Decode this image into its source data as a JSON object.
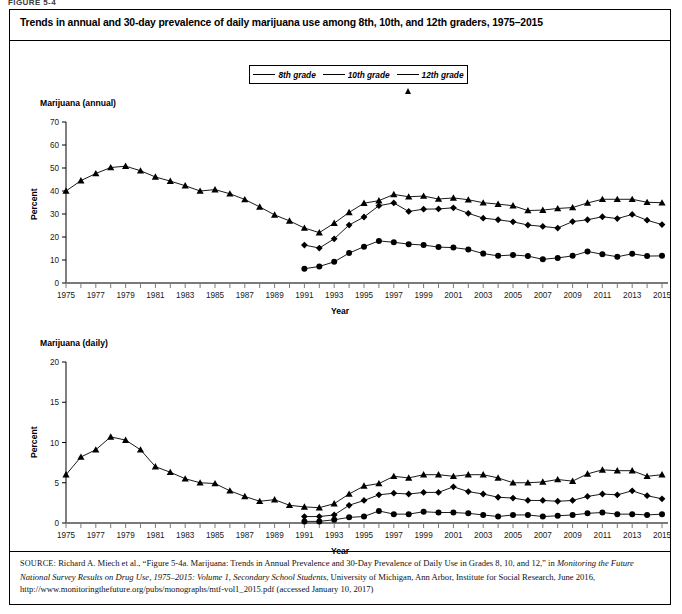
{
  "figure_number": "FIGURE 5-4",
  "title": "Trends in annual and 30-day prevalence of daily marijuana use among 8th, 10th, and 12th graders, 1975–2015",
  "legend": {
    "items": [
      {
        "label": "8th grade",
        "marker": "circle-marker",
        "color": "#000000"
      },
      {
        "label": "10th grade",
        "marker": "diamond-marker",
        "color": "#000000"
      },
      {
        "label": "12th grade",
        "marker": "triangle-marker",
        "color": "#000000"
      }
    ]
  },
  "source": {
    "prefix": "SOURCE:",
    "line1": " Richard A. Miech et al., “Figure 5-4a. Marijuana: Trends in Annual Prevalence and 30-Day Prevalence of Daily Use in Grades 8, 10, and 12,” in ",
    "italic1": "Monitoring the Future National Survey Results on Drug Use, 1975–2015: Volume 1, Secondary School Students",
    "line2": ", University of Michigan, Ann Arbor, Institute for Social Research, June 2016, http://www.monitoringthefuture.org/pubs/monographs/mtf-vol1_2015.pdf (accessed January 10, 2017)"
  },
  "chart_data": [
    {
      "type": "line",
      "title": "Marijuana (annual)",
      "xlabel": "Year",
      "ylabel": "Percent",
      "ylim": [
        0,
        70
      ],
      "yticks": [
        0,
        10,
        20,
        30,
        40,
        50,
        60,
        70
      ],
      "xlim": [
        1975,
        2015
      ],
      "xticks": [
        1975,
        1976,
        1977,
        1978,
        1979,
        1980,
        1981,
        1982,
        1983,
        1984,
        1985,
        1986,
        1987,
        1988,
        1989,
        1990,
        1991,
        1992,
        1993,
        1994,
        1995,
        1996,
        1997,
        1998,
        1999,
        2000,
        2001,
        2002,
        2003,
        2004,
        2005,
        2006,
        2007,
        2008,
        2009,
        2010,
        2011,
        2012,
        2013,
        2014,
        2015
      ],
      "xticklabels": [
        "1975",
        "",
        "1977",
        "",
        "1979",
        "",
        "1981",
        "",
        "1983",
        "",
        "1985",
        "",
        "1987",
        "",
        "1989",
        "",
        "1991",
        "",
        "1993",
        "",
        "1995",
        "",
        "1997",
        "",
        "1999",
        "",
        "2001",
        "",
        "2003",
        "",
        "2005",
        "",
        "2007",
        "",
        "2009",
        "",
        "2011",
        "",
        "2013",
        "",
        "2015"
      ],
      "grid": false,
      "legend_position": "above-plot",
      "series": [
        {
          "name": "8th grade",
          "marker": "circle",
          "x": [
            1991,
            1992,
            1993,
            1994,
            1995,
            1996,
            1997,
            1998,
            1999,
            2000,
            2001,
            2002,
            2003,
            2004,
            2005,
            2006,
            2007,
            2008,
            2009,
            2010,
            2011,
            2012,
            2013,
            2014,
            2015
          ],
          "values": [
            6.2,
            7.2,
            9.2,
            13.0,
            15.8,
            18.3,
            17.7,
            16.9,
            16.5,
            15.6,
            15.4,
            14.6,
            12.8,
            11.8,
            12.2,
            11.7,
            10.3,
            10.9,
            11.8,
            13.7,
            12.5,
            11.4,
            12.7,
            11.7,
            11.8
          ]
        },
        {
          "name": "10th grade",
          "marker": "diamond",
          "x": [
            1991,
            1992,
            1993,
            1994,
            1995,
            1996,
            1997,
            1998,
            1999,
            2000,
            2001,
            2002,
            2003,
            2004,
            2005,
            2006,
            2007,
            2008,
            2009,
            2010,
            2011,
            2012,
            2013,
            2014,
            2015
          ],
          "values": [
            16.5,
            15.2,
            19.2,
            25.2,
            28.7,
            33.6,
            34.8,
            31.1,
            32.1,
            32.2,
            32.7,
            30.3,
            28.2,
            27.5,
            26.6,
            25.2,
            24.6,
            23.9,
            26.7,
            27.5,
            28.8,
            28.0,
            29.8,
            27.3,
            25.4
          ]
        },
        {
          "name": "12th grade",
          "marker": "triangle",
          "x": [
            1975,
            1976,
            1977,
            1978,
            1979,
            1980,
            1981,
            1982,
            1983,
            1984,
            1985,
            1986,
            1987,
            1988,
            1989,
            1990,
            1991,
            1992,
            1993,
            1994,
            1995,
            1996,
            1997,
            1998,
            1999,
            2000,
            2001,
            2002,
            2003,
            2004,
            2005,
            2006,
            2007,
            2008,
            2009,
            2010,
            2011,
            2012,
            2013,
            2014,
            2015
          ],
          "values": [
            40.0,
            44.5,
            47.6,
            50.2,
            50.8,
            48.8,
            46.1,
            44.3,
            42.3,
            40.0,
            40.6,
            38.8,
            36.3,
            33.1,
            29.6,
            27.0,
            23.9,
            21.9,
            26.0,
            30.7,
            34.7,
            35.8,
            38.5,
            37.5,
            37.8,
            36.5,
            37.0,
            36.2,
            34.9,
            34.3,
            33.6,
            31.5,
            31.7,
            32.4,
            32.8,
            34.8,
            36.4,
            36.4,
            36.4,
            35.1,
            34.9
          ]
        }
      ]
    },
    {
      "type": "line",
      "title": "Marijuana (daily)",
      "xlabel": "Year",
      "ylabel": "Percent",
      "ylim": [
        0,
        20
      ],
      "yticks": [
        0,
        5,
        10,
        15,
        20
      ],
      "xlim": [
        1975,
        2015
      ],
      "xticks": [
        1975,
        1976,
        1977,
        1978,
        1979,
        1980,
        1981,
        1982,
        1983,
        1984,
        1985,
        1986,
        1987,
        1988,
        1989,
        1990,
        1991,
        1992,
        1993,
        1994,
        1995,
        1996,
        1997,
        1998,
        1999,
        2000,
        2001,
        2002,
        2003,
        2004,
        2005,
        2006,
        2007,
        2008,
        2009,
        2010,
        2011,
        2012,
        2013,
        2014,
        2015
      ],
      "xticklabels": [
        "1975",
        "",
        "1977",
        "",
        "1979",
        "",
        "1981",
        "",
        "1983",
        "",
        "1985",
        "",
        "1987",
        "",
        "1989",
        "",
        "1991",
        "",
        "1993",
        "",
        "1995",
        "",
        "1997",
        "",
        "1999",
        "",
        "2001",
        "",
        "2003",
        "",
        "2005",
        "",
        "2007",
        "",
        "2009",
        "",
        "2011",
        "",
        "2013",
        "",
        "2015"
      ],
      "grid": false,
      "legend_position": "above-plot",
      "series": [
        {
          "name": "8th grade",
          "marker": "circle",
          "x": [
            1991,
            1992,
            1993,
            1994,
            1995,
            1996,
            1997,
            1998,
            1999,
            2000,
            2001,
            2002,
            2003,
            2004,
            2005,
            2006,
            2007,
            2008,
            2009,
            2010,
            2011,
            2012,
            2013,
            2014,
            2015
          ],
          "values": [
            0.2,
            0.2,
            0.4,
            0.7,
            0.8,
            1.5,
            1.1,
            1.1,
            1.4,
            1.3,
            1.3,
            1.2,
            1.0,
            0.8,
            1.0,
            1.0,
            0.8,
            0.9,
            1.0,
            1.2,
            1.3,
            1.1,
            1.1,
            1.0,
            1.1
          ]
        },
        {
          "name": "10th grade",
          "marker": "diamond",
          "x": [
            1991,
            1992,
            1993,
            1994,
            1995,
            1996,
            1997,
            1998,
            1999,
            2000,
            2001,
            2002,
            2003,
            2004,
            2005,
            2006,
            2007,
            2008,
            2009,
            2010,
            2011,
            2012,
            2013,
            2014,
            2015
          ],
          "values": [
            0.8,
            0.8,
            1.0,
            2.2,
            2.8,
            3.5,
            3.7,
            3.6,
            3.8,
            3.8,
            4.5,
            3.9,
            3.6,
            3.2,
            3.1,
            2.8,
            2.8,
            2.7,
            2.8,
            3.3,
            3.6,
            3.5,
            4.0,
            3.4,
            3.0
          ]
        },
        {
          "name": "12th grade",
          "marker": "triangle",
          "x": [
            1975,
            1976,
            1977,
            1978,
            1979,
            1980,
            1981,
            1982,
            1983,
            1984,
            1985,
            1986,
            1987,
            1988,
            1989,
            1990,
            1991,
            1992,
            1993,
            1994,
            1995,
            1996,
            1997,
            1998,
            1999,
            2000,
            2001,
            2002,
            2003,
            2004,
            2005,
            2006,
            2007,
            2008,
            2009,
            2010,
            2011,
            2012,
            2013,
            2014,
            2015
          ],
          "values": [
            6.0,
            8.2,
            9.1,
            10.7,
            10.3,
            9.1,
            7.0,
            6.3,
            5.5,
            5.0,
            4.9,
            4.0,
            3.3,
            2.7,
            2.9,
            2.2,
            2.0,
            1.9,
            2.4,
            3.6,
            4.6,
            4.9,
            5.8,
            5.6,
            6.0,
            6.0,
            5.8,
            6.0,
            6.0,
            5.6,
            5.0,
            5.0,
            5.1,
            5.4,
            5.2,
            6.1,
            6.6,
            6.5,
            6.5,
            5.8,
            6.0
          ]
        }
      ]
    }
  ]
}
